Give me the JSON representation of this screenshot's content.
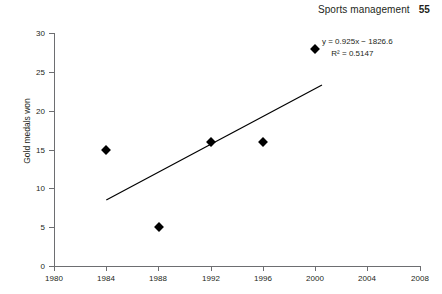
{
  "header": {
    "book_title": "Sports management",
    "page_number": "55"
  },
  "chart_data": {
    "type": "scatter",
    "title": "",
    "xlabel": "",
    "ylabel": "Gold medals won",
    "x": [
      1984,
      1988,
      1992,
      1996,
      2000
    ],
    "values": [
      15,
      5,
      16,
      16,
      28
    ],
    "points": [
      {
        "x": 1984,
        "y": 15
      },
      {
        "x": 1988,
        "y": 5
      },
      {
        "x": 1992,
        "y": 16
      },
      {
        "x": 1996,
        "y": 16
      },
      {
        "x": 2000,
        "y": 28
      }
    ],
    "xlim": [
      1980,
      2008
    ],
    "ylim": [
      0,
      30
    ],
    "xticks": [
      "1980",
      "1984",
      "1988",
      "1992",
      "1996",
      "2000",
      "2004",
      "2008"
    ],
    "yticks": [
      "0",
      "5",
      "10",
      "15",
      "20",
      "25",
      "30"
    ],
    "grid": false,
    "legend": "none",
    "trendline": {
      "type": "linear",
      "slope": 0.925,
      "intercept": -1826.6,
      "r_squared": 0.5147,
      "x_start": 1984,
      "y_start": 8.5,
      "x_end": 2000.5,
      "y_end": 23.3
    },
    "annotations": {
      "equation": "y = 0.925x − 1826.6",
      "r_squared_label": "R² = 0.5147"
    }
  }
}
